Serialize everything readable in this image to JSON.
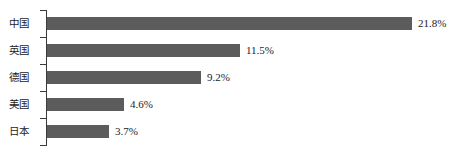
{
  "chart_data": {
    "type": "bar",
    "orientation": "horizontal",
    "title": "",
    "subtitle": "",
    "xlabel": "",
    "ylabel": "",
    "categories": [
      "中国",
      "英国",
      "德国",
      "美国",
      "日本"
    ],
    "values": [
      21.8,
      11.5,
      9.2,
      4.6,
      3.7
    ],
    "value_labels": [
      "21.8%",
      "11.5%",
      "9.2%",
      "4.6%",
      "3.7%"
    ],
    "unit": "%",
    "xlim": [
      0,
      21.8
    ],
    "grid": false,
    "legend": false,
    "legend_position": "none",
    "tick_labels_x": [],
    "annotations": [],
    "bar_color": "#5c5c5c",
    "axis_color": "#3a3a3a",
    "background_color": "#ffffff",
    "text_color": "#1c1c1c",
    "bars": [
      {
        "category": "中国",
        "value": 21.8,
        "label": "21.8%"
      },
      {
        "category": "英国",
        "value": 11.5,
        "label": "11.5%"
      },
      {
        "category": "德国",
        "value": 9.2,
        "label": "9.2%"
      },
      {
        "category": "美国",
        "value": 4.6,
        "label": "4.6%"
      },
      {
        "category": "日本",
        "value": 3.7,
        "label": "3.7%"
      }
    ]
  },
  "layout": {
    "plot_left_px": 47,
    "px_per_unit": 16.74,
    "row_tops_px": [
      17,
      44,
      71,
      98,
      125
    ],
    "bar_height_px": 13
  }
}
